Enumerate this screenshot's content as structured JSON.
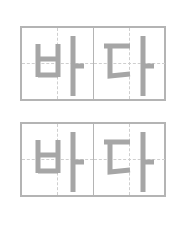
{
  "cards": [
    {
      "syllables": [
        "바",
        "다"
      ],
      "stroke_color": "#a6a6a6"
    },
    {
      "syllables": [
        "바",
        "다"
      ],
      "stroke_color": "#a6a6a6"
    }
  ],
  "colors": {
    "border": "#b4b4b4",
    "guide": "#cfcfcf",
    "glyph": "#a6a6a6"
  }
}
